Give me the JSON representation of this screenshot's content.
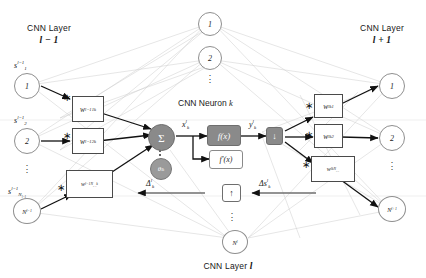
{
  "figure": {
    "headers": {
      "left_title": "CNN Layer",
      "left_layer": "l − 1",
      "right_title": "CNN Layer",
      "right_layer": "l + 1",
      "bottom_title": "CNN Layer",
      "bottom_layer": "l",
      "center_caption": "CNN Neuron",
      "center_caption_index": "k"
    },
    "colors": {
      "node_stroke": "#8f8f8f",
      "sum_fill": "#8a8a8a",
      "box_stroke": "#4a4a4a",
      "activation_fill": "#8a8a8a",
      "wire_dark": "#111111",
      "wire_light": "#c9c9c9",
      "text": "#1a1a1a",
      "background": "#ffffff"
    },
    "left_layer_nodes": [
      {
        "circle": "1",
        "signal_base": "s",
        "signal_sup": "l−1",
        "signal_sub": "1"
      },
      {
        "circle": "2",
        "signal_base": "s",
        "signal_sup": "l−1",
        "signal_sub": "2"
      },
      {
        "circle": "N",
        "circle_sub": "l−1",
        "signal_base": "s",
        "signal_sup": "l−1",
        "signal_sub": "N l−1"
      }
    ],
    "left_weights": [
      {
        "base": "w",
        "sup": "l−1",
        "sub": "1k",
        "operator": "∗"
      },
      {
        "base": "w",
        "sup": "l−1",
        "sub": "2k",
        "operator": "∗"
      },
      {
        "base": "w",
        "sup": "l−1",
        "sub": "N l−1 k",
        "operator": "∗"
      }
    ],
    "top_layer_nodes": [
      {
        "circle": "1"
      },
      {
        "circle": "2"
      }
    ],
    "right_layer_nodes": [
      {
        "circle": "1"
      },
      {
        "circle": "2"
      },
      {
        "circle": "N",
        "circle_sub": "l+1"
      }
    ],
    "right_weights": [
      {
        "base": "w",
        "sup": "l",
        "sub": "k1",
        "operator": "∗"
      },
      {
        "base": "w",
        "sup": "l",
        "sub": "k2",
        "operator": "∗"
      },
      {
        "base": "w",
        "sup": "l",
        "sub": "kN l+1",
        "operator": "∗"
      }
    ],
    "bottom_layer_node": {
      "circle": "N",
      "circle_sub": "l"
    },
    "neuron": {
      "sum_symbol": "Σ",
      "bias_base": "θ",
      "bias_sup": "l",
      "bias_sub": "k",
      "net_input_base": "x",
      "net_input_sup": "l",
      "net_input_sub": "k",
      "activation_label": "f(x)",
      "derivative_label": "f′(x)",
      "output_base": "y",
      "output_sup": "l",
      "output_sub": "k",
      "down_arrow_glyph": "↓",
      "up_arrow_glyph": "↑",
      "delta_out_base": "Δ",
      "delta_out_sup": "l",
      "delta_out_sub": "k",
      "delta_in_base": "Δs",
      "delta_in_sup": "l",
      "delta_in_sub": "k"
    },
    "dots_glyph": "⋮"
  }
}
